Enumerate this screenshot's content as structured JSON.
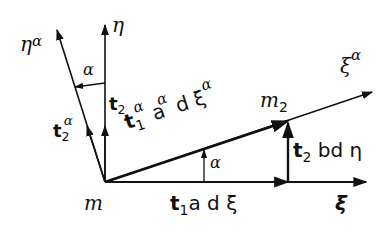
{
  "diagram": {
    "type": "vector-geometry",
    "colors": {
      "stroke": "#111111",
      "background": "#ffffff"
    },
    "points": {
      "origin": {
        "label": "m",
        "x": 105,
        "y": 182
      },
      "m2": {
        "label": "m",
        "sub": "2",
        "x": 288,
        "y": 121
      }
    },
    "axes": {
      "xi": {
        "label": "ξ",
        "end": [
          366,
          182
        ]
      },
      "eta": {
        "label": "η",
        "end": [
          105,
          25
        ]
      },
      "eta_alpha": {
        "label": "η",
        "sup": "α",
        "end": [
          57,
          30
        ]
      },
      "xi_alpha": {
        "label": "ξ",
        "sup": "α",
        "end": [
          372,
          92
        ]
      }
    },
    "vectors": {
      "t2": {
        "bold": "t",
        "sub": "2"
      },
      "t2_alpha": {
        "bold": "t",
        "sub": "2",
        "sup": "α"
      },
      "t1_alpha_seg": {
        "bold": "t",
        "sub": "1",
        "sup": "α",
        "rest": "a",
        "rest_sup": "α",
        "tail": "d ξ",
        "tail_sup": "α"
      },
      "t1_seg": {
        "bold": "t",
        "sub": "1",
        "rest": "a d ξ"
      },
      "t2_seg": {
        "bold": "t",
        "sub": "2",
        "rest": "bd η"
      }
    },
    "angles": {
      "top": "α",
      "bottom": "α"
    }
  }
}
